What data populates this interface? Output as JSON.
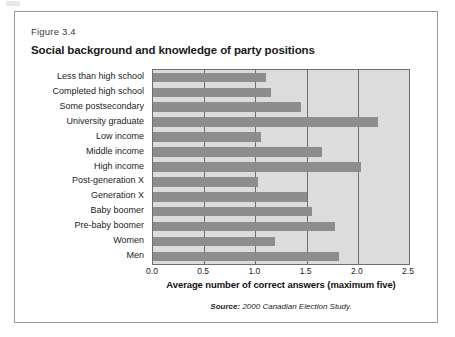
{
  "figure": {
    "number_label": "Figure 3.4",
    "title": "Social background and knowledge of party positions",
    "source_label": "Source:",
    "source_text": " 2000 Canadian Election Study."
  },
  "chart_data": {
    "type": "bar",
    "orientation": "horizontal",
    "title": "Social background and knowledge of party positions",
    "xlabel": "Average number of correct answers (maximum five)",
    "ylabel": "",
    "xlim": [
      0.0,
      2.5
    ],
    "xticks": [
      "0.0",
      "0.5",
      "1.0",
      "1.5",
      "2.0",
      "2.5"
    ],
    "xtick_values": [
      0.0,
      0.5,
      1.0,
      1.5,
      2.0,
      2.5
    ],
    "grid": "vertical",
    "legend": "none",
    "plot_background": "#dcdcdc",
    "bar_color": "#8d8d8d",
    "categories": [
      "Less than high school",
      "Completed high school",
      "Some postsecondary",
      "University graduate",
      "Low income",
      "Middle income",
      "High income",
      "Post-generation X",
      "Generation X",
      "Baby boomer",
      "Pre-baby boomer",
      "Women",
      "Men"
    ],
    "values": [
      1.1,
      1.15,
      1.45,
      2.2,
      1.05,
      1.65,
      2.03,
      1.03,
      1.5,
      1.55,
      1.78,
      1.19,
      1.82
    ],
    "source": "Source: 2000 Canadian Election Study."
  }
}
